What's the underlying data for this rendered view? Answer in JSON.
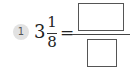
{
  "problem": {
    "number": "1",
    "mixed_number": {
      "whole": "3",
      "numerator": "1",
      "denominator": "8"
    },
    "operator": "=",
    "answer": {
      "numerator_value": "",
      "denominator_value": ""
    }
  },
  "colors": {
    "badge_fill": "#e2e2e2",
    "badge_text": "#555555",
    "text": "#222222",
    "box_border": "#555555"
  }
}
